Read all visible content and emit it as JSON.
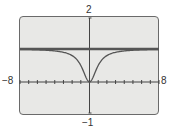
{
  "chart_data": {
    "type": "line",
    "title": "",
    "xlabel": "",
    "ylabel": "",
    "xlim": [
      -8,
      8
    ],
    "ylim": [
      -1,
      2
    ],
    "x_tick_step": 1,
    "window_labels": {
      "ymax": "2",
      "ymin": "-1",
      "xmin": "-8",
      "xmax": "8"
    },
    "grid": false,
    "legend": null,
    "series": [
      {
        "name": "y = x^2/(x^2+1)",
        "style": "thin",
        "x": [
          -8,
          -6,
          -4,
          -3,
          -2,
          -1.5,
          -1,
          -0.5,
          0,
          0.5,
          1,
          1.5,
          2,
          3,
          4,
          6,
          8
        ],
        "y": [
          0.985,
          0.973,
          0.941,
          0.9,
          0.8,
          0.692,
          0.5,
          0.2,
          0,
          0.2,
          0.5,
          0.692,
          0.8,
          0.9,
          0.941,
          0.973,
          0.985
        ]
      },
      {
        "name": "y = 1 (horizontal asymptote)",
        "style": "thick",
        "x": [
          -8,
          8
        ],
        "y": [
          1,
          1
        ]
      }
    ]
  },
  "labels": {
    "top": "2",
    "bottom": "−1",
    "left": "−8",
    "right": "8"
  },
  "colors": {
    "screen_bg": "#e8e8e6",
    "line": "#555555",
    "axis": "#444444"
  }
}
